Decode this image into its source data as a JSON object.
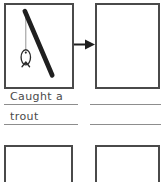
{
  "worksheet": {
    "title": "Story sequence worksheet",
    "panels": [
      {
        "id": "panel-1",
        "state": "drawn",
        "content_description": "fishing rod with line and fish"
      },
      {
        "id": "panel-2",
        "state": "empty",
        "content_description": ""
      },
      {
        "id": "panel-3",
        "state": "empty",
        "content_description": ""
      },
      {
        "id": "panel-4",
        "state": "empty",
        "content_description": ""
      }
    ],
    "arrow": {
      "icon": "arrow-right-icon",
      "direction": "right"
    },
    "drawing": {
      "rod": "fishing-rod",
      "line": "fishing-line",
      "fish": "fish"
    },
    "caption_left": {
      "line1": "Caught a",
      "line2": "trout"
    },
    "caption_right": {
      "line1": "",
      "line2": ""
    },
    "colors": {
      "ink": "#2b2b2b",
      "box_border": "#4a4a4a",
      "rule_line": "#8d8d8d",
      "paper": "#ffffff"
    }
  }
}
